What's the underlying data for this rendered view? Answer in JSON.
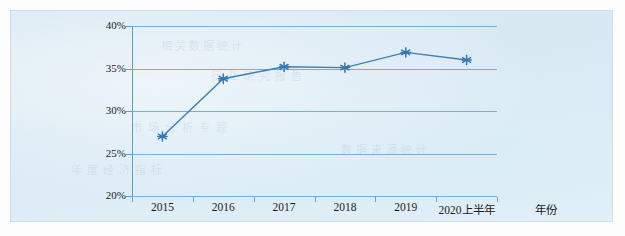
{
  "chart_data": {
    "type": "line",
    "title": "",
    "subtitle": "",
    "xlabel": "年份",
    "ylabel": "",
    "categories": [
      "2015",
      "2016",
      "2017",
      "2018",
      "2019",
      "2020上半年"
    ],
    "values": [
      27.0,
      33.8,
      35.2,
      35.1,
      36.9,
      36.0
    ],
    "series": [
      {
        "name": "",
        "values": [
          27.0,
          33.8,
          35.2,
          35.1,
          36.9,
          36.0
        ]
      }
    ],
    "ylim": [
      20,
      40
    ],
    "ytick_labels": [
      "20%",
      "25%",
      "30%",
      "35%",
      "40%"
    ],
    "ytick_values": [
      20,
      25,
      30,
      35,
      40
    ],
    "grid": true,
    "legend": "none",
    "marker": "asterisk",
    "line_color": "#3f7fb5",
    "marker_color": "#2f78b8",
    "grid_color": "#7aaed2",
    "axis_color": "#5f9cc8",
    "background_color": "#dbeaf4"
  },
  "ghost_text": {
    "line1": "相关数据统计",
    "line2": "行业研究报告",
    "line3": "市场分析专题",
    "line4": "数据来源统计",
    "line5": "年度经济指标"
  }
}
